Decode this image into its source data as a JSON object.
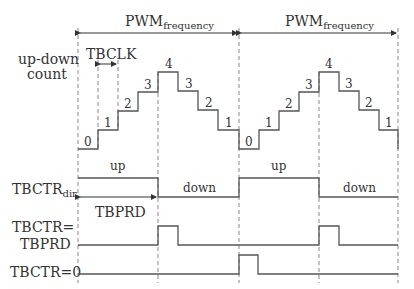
{
  "labels": {
    "pwm_frequency_main": "PWM",
    "pwm_frequency_sub": "frequency",
    "updown": [
      "up-down",
      "count"
    ],
    "tbclk": "TBCLK",
    "tbctr_dir_main": "TBCTR",
    "tbctr_dir_sub": "dir",
    "tbprd": "TBPRD",
    "tbctr_eq_tbprd": [
      "TBCTR=",
      "TBPRD"
    ],
    "tbctr_eq_zero": "TBCTR=0",
    "up": "up",
    "down": "down"
  },
  "counts": [
    "0",
    "1",
    "2",
    "3",
    "4",
    "3",
    "2",
    "1"
  ],
  "colors": {
    "wave": "#555555",
    "dash": "#888888",
    "text": "#333333"
  }
}
